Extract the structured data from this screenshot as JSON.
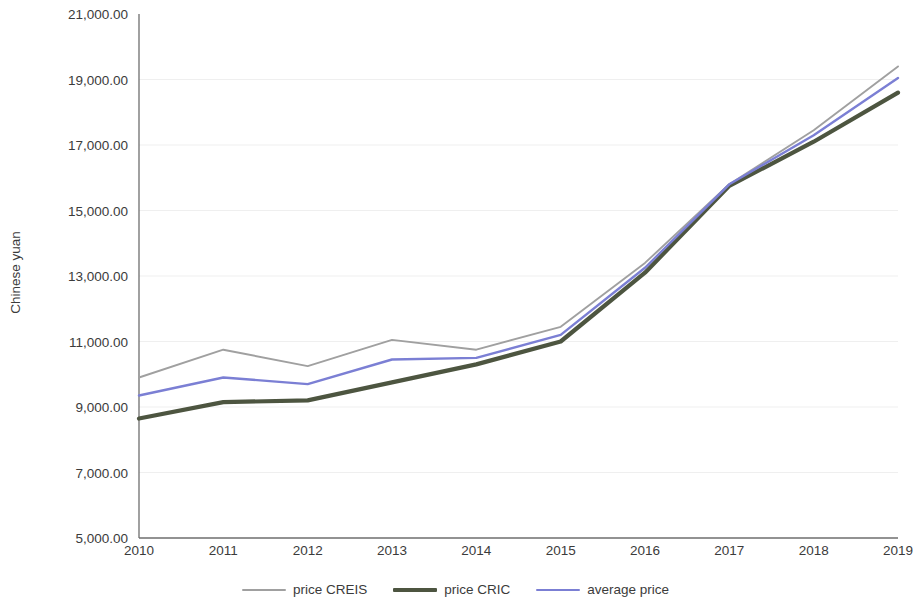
{
  "chart_data": {
    "type": "line",
    "title": "",
    "xlabel": "",
    "ylabel": "Chinese yuan",
    "categories": [
      "2010",
      "2011",
      "2012",
      "2013",
      "2014",
      "2015",
      "2016",
      "2017",
      "2018",
      "2019"
    ],
    "ylim": [
      5000,
      21000
    ],
    "ytick_step": 2000,
    "ytick_labels": [
      "21,000.00",
      "19,000.00",
      "17,000.00",
      "15,000.00",
      "13,000.00",
      "11,000.00",
      "9,000.00",
      "7,000.00",
      "5,000.00"
    ],
    "ytick_values": [
      21000,
      19000,
      17000,
      15000,
      13000,
      11000,
      9000,
      7000,
      5000
    ],
    "grid": true,
    "grid_axis": "y",
    "legend_position": "bottom",
    "series": [
      {
        "name": "price CREIS",
        "color": "#a0a0a0",
        "width": 1.9,
        "values": [
          9900,
          10750,
          10250,
          11050,
          10750,
          11450,
          13400,
          15800,
          17450,
          19400
        ]
      },
      {
        "name": "price CRIC",
        "color": "#4d5540",
        "width": 4.2,
        "values": [
          8650,
          9150,
          9200,
          9750,
          10300,
          11000,
          13100,
          15750,
          17100,
          18600
        ]
      },
      {
        "name": "average price",
        "color": "#7b7fd4",
        "width": 2.4,
        "values": [
          9350,
          9900,
          9700,
          10450,
          10500,
          11200,
          13250,
          15800,
          17300,
          19050
        ]
      }
    ]
  },
  "legend": {
    "items": [
      {
        "label": "price CREIS"
      },
      {
        "label": "price CRIC"
      },
      {
        "label": "average price"
      }
    ]
  },
  "axes": {
    "y_title": "Chinese yuan"
  }
}
